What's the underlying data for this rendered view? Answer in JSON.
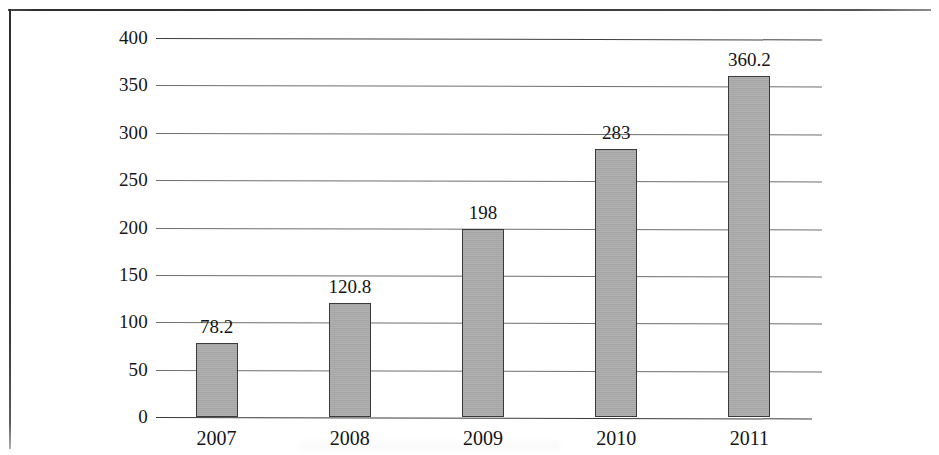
{
  "chart_data": {
    "type": "bar",
    "title": "",
    "xlabel": "",
    "ylabel": "",
    "categories": [
      "2007",
      "2008",
      "2009",
      "2010",
      "2011"
    ],
    "values": [
      78.2,
      120.8,
      198,
      283,
      360.2
    ],
    "value_labels": [
      "78.2",
      "120.8",
      "198",
      "283",
      "360.2"
    ],
    "ylim": [
      0,
      400
    ],
    "ytick_labels": [
      "0",
      "50",
      "100",
      "150",
      "200",
      "250",
      "300",
      "350",
      "400"
    ],
    "ytick_values": [
      0,
      50,
      100,
      150,
      200,
      250,
      300,
      350,
      400
    ],
    "grid": true,
    "grid_axis": "y",
    "legend": null,
    "legend_position": "none",
    "series": [
      {
        "name": "",
        "values": [
          78.2,
          120.8,
          198,
          283,
          360.2
        ],
        "color": "#a9a9a9",
        "edge_color": "#3a3a3a"
      }
    ]
  },
  "colors": {
    "bar_fill": "#a9a9a9",
    "bar_edge": "#3a3a3a",
    "gridline": "#6f6f6f",
    "axis": "#3b3b3b",
    "text": "#141414",
    "background": "#ffffff",
    "frame": "#2e2e2e"
  }
}
